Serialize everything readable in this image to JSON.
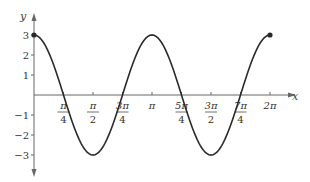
{
  "chart_data": {
    "type": "line",
    "title": "",
    "function": "y = 3cos(2x)",
    "xlabel": "x",
    "ylabel": "y",
    "xlim": [
      0,
      6.2832
    ],
    "ylim": [
      -3,
      3
    ],
    "grid": false,
    "legend": null,
    "x_ticks": [
      {
        "value": 0.7854,
        "num": "π",
        "den": "4"
      },
      {
        "value": 1.5708,
        "num": "π",
        "den": "2"
      },
      {
        "value": 2.3562,
        "num": "3π",
        "den": "4"
      },
      {
        "value": 3.1416,
        "num": "π",
        "den": ""
      },
      {
        "value": 3.927,
        "num": "5π",
        "den": "4"
      },
      {
        "value": 4.7124,
        "num": "3π",
        "den": "2"
      },
      {
        "value": 5.4978,
        "num": "7π",
        "den": "4"
      },
      {
        "value": 6.2832,
        "num": "2π",
        "den": ""
      }
    ],
    "y_ticks": [
      {
        "value": 3,
        "label": "3"
      },
      {
        "value": 2,
        "label": "2"
      },
      {
        "value": 1,
        "label": "1"
      },
      {
        "value": -1,
        "label": "−1"
      },
      {
        "value": -2,
        "label": "−2"
      },
      {
        "value": -3,
        "label": "−3"
      }
    ],
    "series": [
      {
        "name": "3cos(2x)",
        "x": [
          0,
          0.7854,
          1.5708,
          2.3562,
          3.1416,
          3.927,
          4.7124,
          5.4978,
          6.2832
        ],
        "values": [
          3,
          0,
          -3,
          0,
          3,
          0,
          -3,
          0,
          3
        ]
      }
    ],
    "annotations": [
      {
        "type": "endpoint",
        "x": 0,
        "y": 3
      },
      {
        "type": "endpoint",
        "x": 6.2832,
        "y": 3
      }
    ]
  },
  "style": {
    "curve_color": "#2a2a2a",
    "axis_color": "#666666",
    "label_color": "#333333"
  }
}
